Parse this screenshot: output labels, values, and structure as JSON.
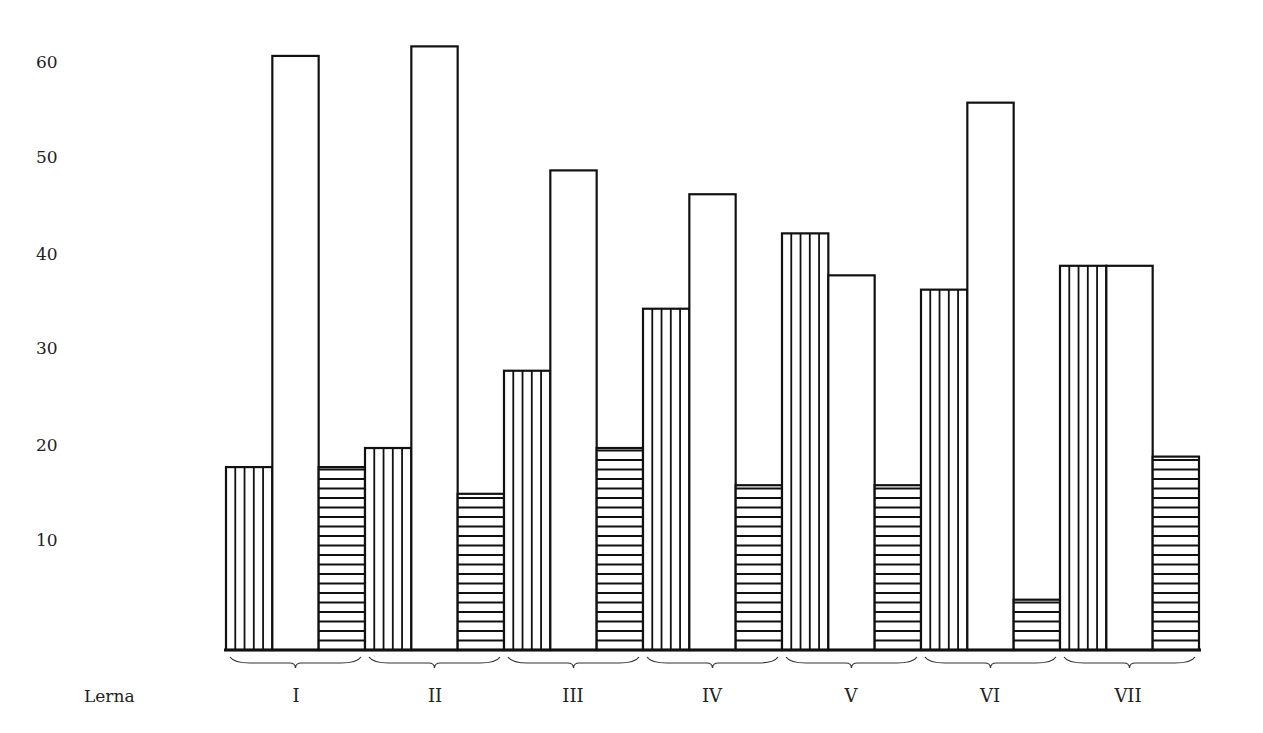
{
  "chart_data": {
    "type": "bar",
    "title": "",
    "xlabel": "Lerna",
    "ylabel": "",
    "categories": [
      "I",
      "II",
      "III",
      "IV",
      "V",
      "VI",
      "VII"
    ],
    "series": [
      {
        "name": "vertical-hatched",
        "pattern": "vertical",
        "values": [
          17.6,
          19.6,
          27.7,
          34.2,
          42.1,
          36.2,
          38.7
        ]
      },
      {
        "name": "white",
        "pattern": "none",
        "values": [
          60.7,
          61.7,
          48.7,
          46.2,
          37.7,
          55.8,
          38.7
        ]
      },
      {
        "name": "horizontal-hatched",
        "pattern": "horizontal",
        "values": [
          17.6,
          14.8,
          19.6,
          15.7,
          15.7,
          3.7,
          18.7
        ]
      }
    ],
    "yticks": [
      10,
      20,
      30,
      40,
      50,
      60
    ],
    "ylim": [
      0,
      65
    ],
    "grid": false,
    "legend": "none"
  },
  "labels": {
    "row_title": "Lerna",
    "yticks": [
      "60",
      "50",
      "40",
      "30",
      "20",
      "10"
    ],
    "categories": [
      "I",
      "II",
      "III",
      "IV",
      "V",
      "VI",
      "VII"
    ]
  },
  "colors": {
    "ink": "#111111",
    "background": "#ffffff"
  }
}
